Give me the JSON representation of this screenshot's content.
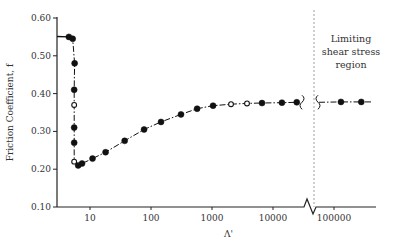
{
  "chart_data": {
    "type": "line",
    "title": "",
    "xlabel": "Λ'",
    "ylabel": "Friction Coefficient, f",
    "xscale": "log",
    "xlim": [
      3.5,
      500000
    ],
    "ylim": [
      0.1,
      0.6
    ],
    "x_ticks": [
      "10",
      "100",
      "1000",
      "10000",
      "100000"
    ],
    "y_ticks": [
      "0.10",
      "0.20",
      "0.30",
      "0.40",
      "0.50",
      "0.60"
    ],
    "grid": false,
    "axis_break": {
      "between": [
        25000,
        50000
      ],
      "note": "x-axis and curve broken between ~30000 and ~50000"
    },
    "annotations": [
      {
        "text": "Limiting shear stress region",
        "lines": [
          "Limiting",
          "shear stress",
          "region"
        ],
        "x_boundary": 50000,
        "style": "dashed vertical line"
      }
    ],
    "series": [
      {
        "name": "filled markers",
        "marker": "filled circle",
        "points": [
          {
            "x": 4.5,
            "y": 0.55
          },
          {
            "x": 5.2,
            "y": 0.545
          },
          {
            "x": 5.6,
            "y": 0.48
          },
          {
            "x": 5.5,
            "y": 0.41
          },
          {
            "x": 5.5,
            "y": 0.31
          },
          {
            "x": 5.5,
            "y": 0.27
          },
          {
            "x": 6.4,
            "y": 0.21
          },
          {
            "x": 7.4,
            "y": 0.215
          },
          {
            "x": 11,
            "y": 0.228
          },
          {
            "x": 18,
            "y": 0.245
          },
          {
            "x": 37,
            "y": 0.275
          },
          {
            "x": 77,
            "y": 0.305
          },
          {
            "x": 146,
            "y": 0.325
          },
          {
            "x": 310,
            "y": 0.345
          },
          {
            "x": 570,
            "y": 0.36
          },
          {
            "x": 1040,
            "y": 0.368
          },
          {
            "x": 6600,
            "y": 0.375
          },
          {
            "x": 14000,
            "y": 0.376
          },
          {
            "x": 24500,
            "y": 0.377
          },
          {
            "x": 130000,
            "y": 0.378
          },
          {
            "x": 280000,
            "y": 0.378
          }
        ]
      },
      {
        "name": "open markers",
        "marker": "open circle",
        "points": [
          {
            "x": 5.5,
            "y": 0.37
          },
          {
            "x": 5.5,
            "y": 0.22
          },
          {
            "x": 2050,
            "y": 0.372
          },
          {
            "x": 3750,
            "y": 0.374
          }
        ]
      }
    ]
  }
}
